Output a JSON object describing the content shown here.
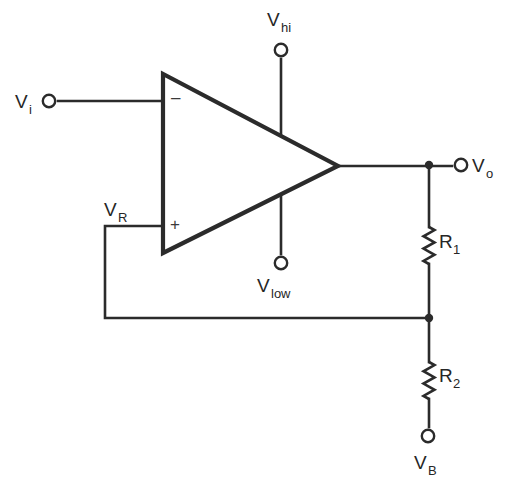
{
  "diagram": {
    "type": "schematic",
    "background_color": "#ffffff",
    "wire_color": "#2b2b2b",
    "text_color": "#262626"
  },
  "terminals": [
    {
      "id": "vi",
      "label_main": "V",
      "label_sub": "i",
      "name": "terminal-vi",
      "x": 49,
      "y": 101,
      "label_x": 15,
      "label_y": 108,
      "sub_x": 29,
      "sub_y": 114
    },
    {
      "id": "vhi",
      "label_main": "V",
      "label_sub": "hi",
      "name": "terminal-vhi",
      "x": 281,
      "y": 50,
      "label_x": 267,
      "label_y": 26,
      "sub_x": 281,
      "sub_y": 32
    },
    {
      "id": "vlow",
      "label_main": "V",
      "label_sub": "low",
      "name": "terminal-vlow",
      "x": 281,
      "y": 263,
      "label_x": 257,
      "label_y": 292,
      "sub_x": 271,
      "sub_y": 298
    },
    {
      "id": "vo",
      "label_main": "V",
      "label_sub": "o",
      "name": "terminal-vo",
      "x": 461,
      "y": 165,
      "label_x": 472,
      "label_y": 172,
      "sub_x": 486,
      "sub_y": 178
    },
    {
      "id": "vb",
      "label_main": "V",
      "label_sub": "B",
      "name": "terminal-vb",
      "x": 428,
      "y": 436,
      "label_x": 414,
      "label_y": 469,
      "sub_x": 428,
      "sub_y": 475
    }
  ],
  "opamp": {
    "name": "op-amp-triangle",
    "points": "163,74 163,253 338,166",
    "inverting_input": {
      "sign": "–",
      "name": "inverting-input-sign",
      "x": 171,
      "y": 103
    },
    "non_inverting_input": {
      "sign": "+",
      "name": "non-inverting-input-sign",
      "x": 170,
      "y": 230
    }
  },
  "resistors": [
    {
      "id": "r1",
      "label_main": "R",
      "label_sub": "1",
      "name": "resistor-r1",
      "cx": 429,
      "top": 227,
      "bottom": 264,
      "label_x": 439,
      "label_y": 248,
      "sub_x": 453,
      "sub_y": 254
    },
    {
      "id": "r2",
      "label_main": "R",
      "label_sub": "2",
      "name": "resistor-r2",
      "cx": 429,
      "top": 362,
      "bottom": 399,
      "label_x": 439,
      "label_y": 382,
      "sub_x": 453,
      "sub_y": 388
    }
  ],
  "feedback": {
    "label_main": "V",
    "label_sub": "R",
    "name": "feedback-node-label",
    "label_x": 104,
    "label_y": 216,
    "sub_x": 118,
    "sub_y": 222
  },
  "junctions": [
    {
      "name": "junction-output-node",
      "x": 429,
      "y": 165
    },
    {
      "name": "junction-divider-node",
      "x": 429,
      "y": 318
    }
  ],
  "wires": [
    {
      "name": "wire-vi-to-inverting-input",
      "d": "M 58 101 L 163 101"
    },
    {
      "name": "wire-vhi-to-opamp",
      "d": "M 281 59 L 281 166"
    },
    {
      "name": "wire-vlow-to-opamp",
      "d": "M 281 254 L 281 166"
    },
    {
      "name": "wire-output-to-vo",
      "d": "M 338 166 L 452 166"
    },
    {
      "name": "wire-output-node-to-r1",
      "d": "M 429 166 L 429 227"
    },
    {
      "name": "wire-r1-to-divider-node",
      "d": "M 429 264 L 429 318"
    },
    {
      "name": "wire-divider-node-to-r2",
      "d": "M 429 318 L 429 362"
    },
    {
      "name": "wire-r2-to-vb",
      "d": "M 429 399 L 429 427"
    },
    {
      "name": "wire-feedback-from-plus-input",
      "d": "M 163 226 L 105 226 L 105 318 L 429 318"
    }
  ]
}
